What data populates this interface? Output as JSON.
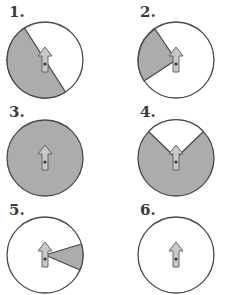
{
  "colors": {
    "shade": "#acacac",
    "outline": "#4a4a4a",
    "arrow_fill": "#c8c8c8",
    "background": "#ffffff"
  },
  "spinners": [
    {
      "label": "1.",
      "shaded_description": "left half shaded, boundary diagonal from upper-left to lower-right"
    },
    {
      "label": "2.",
      "shaded_description": "small wedge on left side shaded"
    },
    {
      "label": "3.",
      "shaded_description": "entire circle shaded"
    },
    {
      "label": "4.",
      "shaded_description": "all shaded except top wedge"
    },
    {
      "label": "5.",
      "shaded_description": "small wedge on right side shaded"
    },
    {
      "label": "6.",
      "shaded_description": "no shading"
    }
  ]
}
